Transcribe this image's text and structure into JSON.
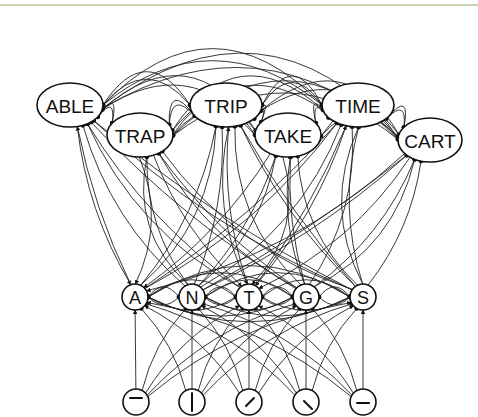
{
  "diagram": {
    "type": "interactive-activation network",
    "layers": {
      "word": {
        "nodes": [
          {
            "label": "ABLE",
            "cx": 70,
            "cy": 105,
            "rx": 33,
            "ry": 22
          },
          {
            "label": "TRAP",
            "cx": 140,
            "cy": 135,
            "rx": 33,
            "ry": 22
          },
          {
            "label": "TRIP",
            "cx": 226,
            "cy": 105,
            "rx": 36,
            "ry": 22
          },
          {
            "label": "TAKE",
            "cx": 288,
            "cy": 135,
            "rx": 33,
            "ry": 22
          },
          {
            "label": "TIME",
            "cx": 358,
            "cy": 105,
            "rx": 36,
            "ry": 22
          },
          {
            "label": "CART",
            "cx": 430,
            "cy": 140,
            "rx": 32,
            "ry": 22
          }
        ]
      },
      "letter": {
        "nodes": [
          {
            "label": "A",
            "cx": 135,
            "cy": 297,
            "r": 13
          },
          {
            "label": "N",
            "cx": 192,
            "cy": 297,
            "r": 13
          },
          {
            "label": "T",
            "cx": 249,
            "cy": 297,
            "r": 13
          },
          {
            "label": "G",
            "cx": 306,
            "cy": 297,
            "r": 13
          },
          {
            "label": "S",
            "cx": 363,
            "cy": 297,
            "r": 13
          }
        ]
      },
      "feature": {
        "nodes": [
          {
            "name": "horizontal-top-bar",
            "cx": 136,
            "cy": 402,
            "r": 13
          },
          {
            "name": "vertical-bar",
            "cx": 192,
            "cy": 402,
            "r": 13
          },
          {
            "name": "diagonal-up-right",
            "cx": 249,
            "cy": 402,
            "r": 13
          },
          {
            "name": "diagonal-down-right",
            "cx": 306,
            "cy": 402,
            "r": 13
          },
          {
            "name": "horizontal-middle-bar",
            "cx": 363,
            "cy": 402,
            "r": 13
          }
        ]
      }
    },
    "connections": {
      "excitatory": "arrowheads",
      "inhibitory": "filled dots"
    },
    "colors": {
      "line": "#222222",
      "top_rule": "#c9d3b4",
      "background": "#ffffff"
    }
  }
}
